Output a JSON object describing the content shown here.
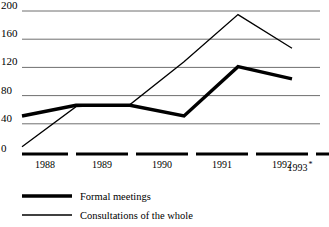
{
  "chart_data": {
    "type": "line",
    "title": "",
    "subtitle": "",
    "xlabel": "",
    "ylabel": "",
    "categories": [
      "1988",
      "1989",
      "1990",
      "1991",
      "1992",
      "1993 *"
    ],
    "x_tick_labels": [
      "1988",
      "1989",
      "1990",
      "1991",
      "1992",
      "1993"
    ],
    "x_tick_note": "*",
    "y_tick_labels": [
      "0",
      "40",
      "80",
      "120",
      "160",
      "200"
    ],
    "y_ticks": [
      0,
      40,
      80,
      120,
      160,
      200
    ],
    "ylim": [
      0,
      200
    ],
    "grid": true,
    "grid_axis": "y",
    "legend_position": "bottom-left",
    "series": [
      {
        "name": "Formal meetings",
        "style": "thick",
        "color": "#000000",
        "values": [
          53,
          68,
          68,
          53,
          122,
          105
        ]
      },
      {
        "name": "Consultations of the whole",
        "style": "thin",
        "color": "#000000",
        "values": [
          10,
          66,
          69,
          129,
          195,
          148
        ]
      }
    ]
  },
  "axis": {
    "y_labels": [
      "200",
      "160",
      "120",
      "80",
      "40",
      "0"
    ],
    "x_labels": [
      {
        "text": "1988",
        "note": ""
      },
      {
        "text": "1989",
        "note": ""
      },
      {
        "text": "1990",
        "note": ""
      },
      {
        "text": "1991",
        "note": ""
      },
      {
        "text": "1992",
        "note": ""
      },
      {
        "text": "1993",
        "note": "*"
      }
    ]
  },
  "legend": {
    "entries": [
      {
        "label": "Formal meetings",
        "swatch": "thick-line-swatch"
      },
      {
        "label": "Consultations of the whole",
        "swatch": "thin-line-swatch"
      }
    ]
  },
  "colors": {
    "line": "#000000",
    "gridline": "#7a7a7a",
    "background": "#ffffff"
  }
}
